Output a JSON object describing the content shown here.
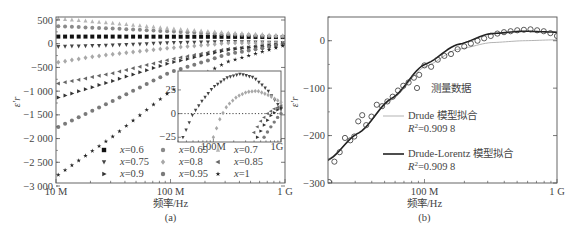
{
  "chart_data": [
    {
      "id": "a",
      "type": "scatter",
      "caption": "(a)",
      "title": "",
      "xlabel": "频率/Hz",
      "ylabel": "ε′r",
      "xscale": "log",
      "xlim": [
        10000000,
        1000000000
      ],
      "ylim": [
        -3000,
        500
      ],
      "xticks": [
        {
          "value": 10000000,
          "label": "10 M"
        },
        {
          "value": 100000000,
          "label": "100 M"
        },
        {
          "value": 1000000000,
          "label": "1 G"
        }
      ],
      "yticks": [
        {
          "value": 500,
          "label": "500"
        },
        {
          "value": 0,
          "label": "0"
        },
        {
          "value": -500,
          "label": "−500"
        },
        {
          "value": -1000,
          "label": "−1 000"
        },
        {
          "value": -1500,
          "label": "−1 500"
        },
        {
          "value": -2000,
          "label": "−2 000"
        },
        {
          "value": -2500,
          "label": "−2 500"
        },
        {
          "value": -3000,
          "label": "−3 000"
        }
      ],
      "grid": false,
      "legend_position": "lower-right",
      "legend_columns": 3,
      "series": [
        {
          "name": "x=0.6",
          "label_prefix": "x",
          "label_value": "=0.6",
          "marker": "square",
          "color": "#111111",
          "x_log": [
            7.0,
            7.5,
            8.0,
            8.5,
            9.0
          ],
          "y": [
            150,
            150,
            148,
            145,
            140
          ]
        },
        {
          "name": "x=0.65",
          "label_prefix": "x",
          "label_value": "=0.65",
          "marker": "circle",
          "color": "#8a8a8a",
          "x_log": [
            7.0,
            7.5,
            8.0,
            8.5,
            9.0
          ],
          "y": [
            370,
            320,
            260,
            200,
            150
          ]
        },
        {
          "name": "x=0.7",
          "label_prefix": "x",
          "label_value": "=0.7",
          "marker": "triangle-up",
          "color": "#b5b5b5",
          "x_log": [
            7.0,
            7.5,
            8.0,
            8.5,
            9.0
          ],
          "y": [
            530,
            430,
            320,
            230,
            170
          ]
        },
        {
          "name": "x=0.75",
          "label_prefix": "x",
          "label_value": "=0.75",
          "marker": "triangle-down",
          "color": "#444444",
          "x_log": [
            7.0,
            7.5,
            8.0,
            8.5,
            9.0
          ],
          "y": [
            -60,
            -30,
            20,
            45,
            25
          ]
        },
        {
          "name": "x=0.8",
          "label_prefix": "x",
          "label_value": "=0.8",
          "marker": "diamond",
          "color": "#a8a8a8",
          "x_log": [
            7.0,
            7.3,
            7.5,
            8.0,
            8.5,
            9.0
          ],
          "y": [
            -400,
            -280,
            -220,
            -90,
            15,
            15
          ]
        },
        {
          "name": "x=0.85",
          "label_prefix": "x",
          "label_value": "=0.85",
          "marker": "triangle-left",
          "color": "#666666",
          "x_log": [
            7.0,
            7.5,
            8.0,
            8.5,
            9.0
          ],
          "y": [
            -850,
            -620,
            -330,
            -110,
            5
          ]
        },
        {
          "name": "x=0.9",
          "label_prefix": "x",
          "label_value": "=0.9",
          "marker": "triangle-right",
          "color": "#333333",
          "x_log": [
            7.0,
            7.5,
            8.0,
            8.5,
            9.0
          ],
          "y": [
            -1150,
            -780,
            -400,
            -130,
            0
          ]
        },
        {
          "name": "x=0.95",
          "label_prefix": "x",
          "label_value": "=0.95",
          "marker": "circle",
          "color": "#7a7a7a",
          "x_log": [
            7.0,
            7.5,
            8.0,
            8.5,
            9.0
          ],
          "y": [
            -1780,
            -1200,
            -600,
            -220,
            -10
          ]
        },
        {
          "name": "x=1",
          "label_prefix": "x",
          "label_value": "=1",
          "marker": "star",
          "color": "#222222",
          "x_log": [
            7.0,
            7.5,
            8.0,
            8.5,
            9.0
          ],
          "y": [
            -2800,
            -1950,
            -1000,
            -380,
            -30
          ]
        }
      ],
      "inset": {
        "xscale": "log",
        "xlim": [
          30000000,
          1000000000
        ],
        "ylim": [
          -30,
          45
        ],
        "xticks": [
          {
            "value": 100000000,
            "label": "100M"
          },
          {
            "value": 1000000000,
            "label": "1G"
          }
        ],
        "yticks": [
          {
            "value": 25,
            "label": "25"
          },
          {
            "value": 0,
            "label": "0"
          },
          {
            "value": -25,
            "label": "−25"
          }
        ],
        "zero_line": "dotted",
        "series": [
          {
            "name": "x=0.75",
            "x_log": [
              7.55,
              7.7,
              7.85,
              8.0,
              8.2,
              8.4,
              8.6,
              8.8,
              9.0
            ],
            "y": [
              -25,
              0,
              15,
              28,
              38,
              42,
              38,
              25,
              5
            ]
          },
          {
            "name": "x=0.8",
            "x_log": [
              8.0,
              8.1,
              8.2,
              8.35,
              8.5,
              8.65,
              8.8,
              9.0
            ],
            "y": [
              -25,
              -5,
              8,
              18,
              23,
              24,
              20,
              12
            ]
          },
          {
            "name": "x=0.85",
            "x_log": [
              8.6,
              8.7,
              8.8,
              8.9,
              9.0
            ],
            "y": [
              -20,
              -8,
              0,
              5,
              8
            ]
          },
          {
            "name": "x=0.9",
            "x_log": [
              8.65,
              8.75,
              8.85,
              8.95,
              9.0
            ],
            "y": [
              -25,
              -12,
              -2,
              4,
              6
            ]
          },
          {
            "name": "x=0.95",
            "x_log": [
              8.75,
              8.85,
              8.95,
              9.0
            ],
            "y": [
              -25,
              -14,
              -4,
              0
            ]
          }
        ]
      }
    },
    {
      "id": "b",
      "type": "scatter",
      "caption": "(b)",
      "title": "",
      "xlabel": "频率/Hz",
      "ylabel": "ε′r",
      "xscale": "log",
      "xlim": [
        18700000,
        1000000000
      ],
      "ylim": [
        -300,
        50
      ],
      "xticks": [
        {
          "value": 100000000,
          "label": "100 M"
        },
        {
          "value": 1000000000,
          "label": "1 G"
        }
      ],
      "yticks": [
        {
          "value": 0,
          "label": "0"
        },
        {
          "value": -100,
          "label": "−100"
        },
        {
          "value": -200,
          "label": "−200"
        },
        {
          "value": -300,
          "label": "−300"
        }
      ],
      "grid": false,
      "legend_position": "center-right",
      "series": [
        {
          "name": "测量数据",
          "marker": "open-circle",
          "color": "#333333",
          "x_log": [
            7.28,
            7.32,
            7.36,
            7.4,
            7.44,
            7.47,
            7.5,
            7.53,
            7.56,
            7.6,
            7.64,
            7.68,
            7.72,
            7.76,
            7.8,
            7.84,
            7.88,
            7.92,
            7.96,
            8.0,
            8.05,
            8.1,
            8.15,
            8.2,
            8.25,
            8.3,
            8.35,
            8.4,
            8.45,
            8.5,
            8.55,
            8.6,
            8.65,
            8.7,
            8.75,
            8.8,
            8.85,
            8.9,
            8.95,
            9.0
          ],
          "y": [
            -298,
            -255,
            -235,
            -205,
            -210,
            -202,
            -170,
            -157,
            -178,
            -160,
            -135,
            -138,
            -128,
            -118,
            -105,
            -95,
            -88,
            -78,
            -72,
            -52,
            -55,
            -40,
            -32,
            -28,
            -18,
            -12,
            -6,
            0,
            5,
            10,
            15,
            18,
            20,
            22,
            23,
            24,
            22,
            20,
            16,
            10
          ]
        },
        {
          "name": "Drude 模型拟合",
          "r2_label": "R²=0.909 8",
          "line": "solid-thin",
          "color": "#aaaaaa",
          "x_log": [
            7.27,
            7.5,
            7.75,
            8.0,
            8.25,
            8.5,
            8.75,
            9.0
          ],
          "y": [
            -250,
            -195,
            -125,
            -55,
            -18,
            -4,
            0,
            2
          ]
        },
        {
          "name": "Drude-Lorentz 模型拟合",
          "r2_label": "R²=0.909 8",
          "line": "solid-thick",
          "color": "#222222",
          "x_log": [
            7.27,
            7.5,
            7.75,
            8.0,
            8.25,
            8.5,
            8.75,
            9.0
          ],
          "y": [
            -252,
            -195,
            -122,
            -50,
            -8,
            15,
            20,
            18
          ]
        }
      ]
    }
  ],
  "panel_a": {
    "caption": "(a)",
    "xlabel": "频率/Hz",
    "ylabel": "ε′r",
    "legend": [
      {
        "v": "=0.6"
      },
      {
        "v": "=0.65"
      },
      {
        "v": "=0.7"
      },
      {
        "v": "=0.75"
      },
      {
        "v": "=0.8"
      },
      {
        "v": "=0.85"
      },
      {
        "v": "=0.9"
      },
      {
        "v": "=0.95"
      },
      {
        "v": "=1"
      }
    ]
  },
  "panel_b": {
    "caption": "(b)",
    "xlabel": "频率/Hz",
    "ylabel": "ε′r",
    "legend": {
      "measured": "测量数据",
      "drude": "Drude 模型拟合",
      "drude_r2": "=0.909 8",
      "dl": "Drude-Lorentz 模型拟合",
      "dl_r2": "=0.909 8",
      "r_symbol": "R",
      "r_sup": "2"
    }
  },
  "colors": {
    "axis": "#555555",
    "text": "#444444",
    "background": "#ffffff"
  }
}
